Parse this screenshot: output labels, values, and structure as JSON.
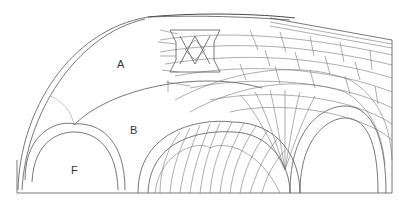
{
  "diagram": {
    "title": "",
    "type": "architectural vault stonework line drawing",
    "labels": [
      {
        "id": "A",
        "text": "A",
        "x": 120,
        "y": 64
      },
      {
        "id": "B",
        "text": "B",
        "x": 130,
        "y": 125
      },
      {
        "id": "F",
        "text": "F",
        "x": 70,
        "y": 165
      }
    ],
    "colors": {
      "background": "#ffffff",
      "line": "#555555"
    }
  }
}
